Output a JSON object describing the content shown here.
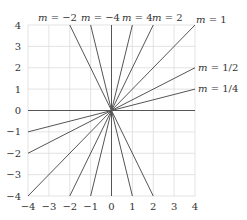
{
  "chart_data": {
    "type": "line",
    "title": "",
    "xlabel": "",
    "ylabel": "",
    "xlim": [
      -4,
      4
    ],
    "ylim": [
      -4,
      4
    ],
    "grid": true,
    "x_ticks": [
      "−4",
      "−3",
      "−2",
      "−1",
      "0",
      "1",
      "2",
      "3",
      "4"
    ],
    "y_ticks": [
      "4",
      "3",
      "2",
      "1",
      "0",
      "−1",
      "−2",
      "−3",
      "−4"
    ],
    "series": [
      {
        "name": "m = 1/4",
        "slope": 0.25,
        "points": [
          [
            -4,
            -1
          ],
          [
            4,
            1
          ]
        ]
      },
      {
        "name": "m = 1/2",
        "slope": 0.5,
        "points": [
          [
            -4,
            -2
          ],
          [
            4,
            2
          ]
        ]
      },
      {
        "name": "m = 1",
        "slope": 1,
        "points": [
          [
            -4,
            -4
          ],
          [
            4,
            4
          ]
        ]
      },
      {
        "name": "m = 2",
        "slope": 2,
        "points": [
          [
            -2,
            -4
          ],
          [
            2,
            4
          ]
        ]
      },
      {
        "name": "m = 4",
        "slope": 4,
        "points": [
          [
            -1,
            -4
          ],
          [
            1,
            4
          ]
        ]
      },
      {
        "name": "m = −4",
        "slope": -4,
        "points": [
          [
            -1,
            4
          ],
          [
            1,
            -4
          ]
        ]
      },
      {
        "name": "m = −2",
        "slope": -2,
        "points": [
          [
            -2,
            4
          ],
          [
            2,
            -4
          ]
        ]
      },
      {
        "name": "m = 0",
        "slope": 0,
        "points": [
          [
            -4,
            0
          ],
          [
            4,
            0
          ]
        ]
      }
    ],
    "annotations": [
      {
        "text": "m = −2",
        "position": "top"
      },
      {
        "text": "m = −4",
        "position": "top"
      },
      {
        "text": "m = 4",
        "position": "top"
      },
      {
        "text": "m = 2",
        "position": "top"
      },
      {
        "text": "m = 1",
        "position": "top-right"
      },
      {
        "text": "m = 1/2",
        "position": "right"
      },
      {
        "text": "m = 1/4",
        "position": "right"
      }
    ]
  },
  "labels": {
    "m_neg2": "−2",
    "m_neg4": "−4",
    "m_4": "4",
    "m_2": "2",
    "m_1": "1",
    "m_half": "1/2",
    "m_quarter": "1/4",
    "m_var": "m",
    "eq": " = "
  },
  "ticks": {
    "x": [
      "−4",
      "−3",
      "−2",
      "−1",
      "0",
      "1",
      "2",
      "3",
      "4"
    ],
    "y": [
      "4",
      "3",
      "2",
      "1",
      "0",
      "−1",
      "−2",
      "−3",
      "−4"
    ]
  }
}
